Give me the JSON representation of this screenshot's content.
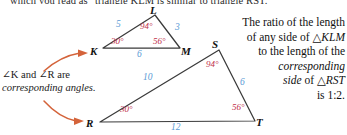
{
  "header": {
    "clipped_text": "which you read as \"triangle KLM is similar to triangle RST.\""
  },
  "figure": {
    "triangle_klm": {
      "name": "KLM",
      "vertices": [
        {
          "id": "L",
          "label": "L"
        },
        {
          "id": "K",
          "label": "K"
        },
        {
          "id": "M",
          "label": "M"
        }
      ],
      "sides": [
        {
          "id": "KL",
          "label": "5"
        },
        {
          "id": "LM",
          "label": "3"
        },
        {
          "id": "KM",
          "label": "6"
        }
      ],
      "angles": [
        {
          "id": "L",
          "label": "94°"
        },
        {
          "id": "K",
          "label": "30°"
        },
        {
          "id": "M",
          "label": "56°"
        }
      ]
    },
    "triangle_rst": {
      "name": "RST",
      "vertices": [
        {
          "id": "S",
          "label": "S"
        },
        {
          "id": "R",
          "label": "R"
        },
        {
          "id": "T",
          "label": "T"
        }
      ],
      "sides": [
        {
          "id": "RS",
          "label": "10"
        },
        {
          "id": "ST",
          "label": "6"
        },
        {
          "id": "RT",
          "label": "12"
        }
      ],
      "angles": [
        {
          "id": "S",
          "label": "94°"
        },
        {
          "id": "R",
          "label": "30°"
        },
        {
          "id": "T",
          "label": "56°"
        }
      ]
    }
  },
  "caption_left": {
    "line1": "∠K and ∠R are",
    "line2": "corresponding angles."
  },
  "caption_right": {
    "line1": "The ratio of the length",
    "line2_pre": "of any side of ",
    "line2_tri": "△",
    "line2_name": "KLM",
    "line3": "to the length of the",
    "line4": "corresponding",
    "line5_pre": "side",
    "line5_mid": " of ",
    "line5_tri": "△",
    "line5_name": "RST",
    "line6": "is 1:2."
  },
  "colors": {
    "side_length": "#5b9bd5",
    "angle_label": "#c0304a",
    "arrow": "#d4633a",
    "triangle_stroke": "#3a3a3a",
    "text": "#1a1a1a",
    "background": "#ffffff"
  }
}
